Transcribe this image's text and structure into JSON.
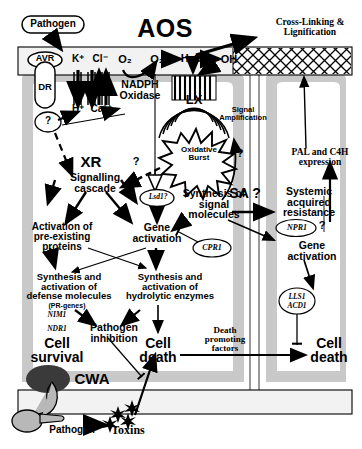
{
  "figure": {
    "title": "AOS",
    "type": "plant-defense-signalling-diagram"
  },
  "colors": {
    "cytoplasm_gray": "#c9c9c9",
    "cell_interior": "#ffffff",
    "wall_fill": "#f2f2f2",
    "cwa_dark": "#3a3a3a",
    "haustorium_gray": "#b8b8b8",
    "stroke": "#000000"
  },
  "apoplast": {
    "pathogen_label": "Pathogen",
    "avr_label": "AVR",
    "dr_label": "DR",
    "aos_label": "AOS",
    "crosslink_label": "Cross-Linking &\nLignification",
    "ions": [
      "K",
      "Cl",
      "H",
      "Ca"
    ],
    "ion_labels": [
      "K⁺",
      "Cl⁻",
      "H⁺",
      "Ca²⁺"
    ],
    "oxygen_label": "O₂",
    "superoxide_label": "O₂⁻",
    "peroxide_label": "H₂O₂",
    "hydroxyl_label": "OH",
    "nadph_label": "NADPH\nOxidase",
    "lx_label": "LX",
    "signal_amplification_label": "Signal\nAmplification",
    "question_mark": "?"
  },
  "left_cell": {
    "receptor_question": "?",
    "xr_label": "XR",
    "signalling_cascade": "Signalling\ncascade",
    "cascade_question": "?",
    "oxidative_burst": "Oxidative\nBurst",
    "lsd1_label": "Lsd1?",
    "synthesis_signal_molecules": "Synthesis of\nsignal\nmolecules",
    "activation_preexisting": "Activation of\npre-existing\nproteins",
    "gene_activation": "Gene\nactivation",
    "cpr1_label": "CPR1",
    "synthesis_defense": "Synthesis and\nactivation of\ndefense molecules",
    "pr_genes_label": "(PR-genes)",
    "nim1_label": "NIM1",
    "ndr1_label": "NDR1",
    "synthesis_hydrolytic": "Synthesis and\nactivation of\nhydrolytic enzymes",
    "pathogen_inhibition": "Pathogen\ninhibition",
    "cell_survival": "Cell\nsurvival",
    "cell_death": "Cell\ndeath",
    "sa_label": "SA ?",
    "amplification_question": "?"
  },
  "right_cell": {
    "pal_c4h": "PAL and C4H\nexpression",
    "systemic_acquired_resistance": "Systemic\nacquired\nresistance",
    "npr1_label": "NPR1",
    "npr1_question": "?",
    "gene_activation": "Gene\nactivation",
    "llsl_acd1_label": "LLS1\nACD1",
    "death_promoting_factors": "Death\npromoting\nfactors",
    "cell_death": "Cell\ndeath"
  },
  "bottom": {
    "cwa_label": "CWA",
    "pathogen_label": "Pathogen",
    "toxins_label": "Toxins"
  }
}
